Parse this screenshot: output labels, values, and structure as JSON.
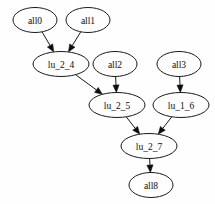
{
  "graph": {
    "type": "directed-acyclic-graph",
    "background_color": "#fefefe",
    "node_fill_color": "#fefefe",
    "node_stroke_color": "#1a1a1a",
    "edge_color": "#1a1a1a",
    "label_color": "#0d0d0d",
    "nodes": [
      {
        "id": "all0",
        "label": "all0",
        "cx": 35,
        "cy": 20,
        "rx": 22,
        "ry": 12.5
      },
      {
        "id": "all1",
        "label": "all1",
        "cx": 88,
        "cy": 20,
        "rx": 22,
        "ry": 12.5
      },
      {
        "id": "lu_2_4",
        "label": "lu_2_4",
        "cx": 61,
        "cy": 64,
        "rx": 28,
        "ry": 12.5
      },
      {
        "id": "all2",
        "label": "all2",
        "cx": 115,
        "cy": 64,
        "rx": 22,
        "ry": 12.5
      },
      {
        "id": "all3",
        "label": "all3",
        "cx": 179,
        "cy": 64,
        "rx": 22,
        "ry": 12.5
      },
      {
        "id": "lu_2_5",
        "label": "lu_2_5",
        "cx": 117,
        "cy": 105,
        "rx": 28,
        "ry": 12.5
      },
      {
        "id": "lu_1_6",
        "label": "lu_1_6",
        "cx": 181,
        "cy": 105,
        "rx": 28,
        "ry": 12.5
      },
      {
        "id": "lu_2_7",
        "label": "lu_2_7",
        "cx": 149,
        "cy": 146,
        "rx": 28,
        "ry": 12.5
      },
      {
        "id": "all8",
        "label": "all8",
        "cx": 151,
        "cy": 185,
        "rx": 22,
        "ry": 12.5
      }
    ],
    "edges": [
      {
        "from": "all0",
        "to": "lu_2_4"
      },
      {
        "from": "all1",
        "to": "lu_2_4"
      },
      {
        "from": "lu_2_4",
        "to": "lu_2_5"
      },
      {
        "from": "all2",
        "to": "lu_2_5"
      },
      {
        "from": "all3",
        "to": "lu_1_6"
      },
      {
        "from": "lu_2_5",
        "to": "lu_2_7"
      },
      {
        "from": "lu_1_6",
        "to": "lu_2_7"
      },
      {
        "from": "lu_2_7",
        "to": "all8"
      }
    ]
  }
}
